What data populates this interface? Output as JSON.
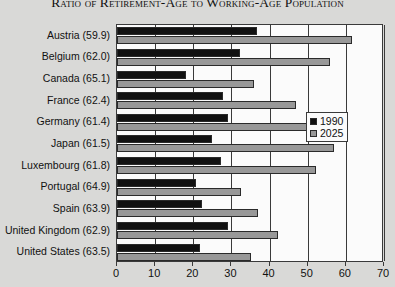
{
  "chart_data": {
    "type": "bar",
    "orientation": "horizontal",
    "title": "Ratio of Retirement-Age to Working-Age Population",
    "xlabel": "",
    "ylabel": "",
    "xlim": [
      0,
      70
    ],
    "xticks": [
      0,
      10,
      20,
      30,
      40,
      50,
      60,
      70
    ],
    "xticklabels": [
      "0",
      "10",
      "20",
      "30",
      "40",
      "50",
      "60",
      "70"
    ],
    "grid": true,
    "grid_axis": "x",
    "legend_position": "center right",
    "categories": [
      "Austria (59.9)",
      "Belgium (62.0)",
      "Canada (65.1)",
      "France (62.4)",
      "Germany (61.4)",
      "Japan (61.5)",
      "Luxembourg (61.8)",
      "Portugal (64.9)",
      "Spain (63.9)",
      "United Kingdom (62.9)",
      "United States (63.5)"
    ],
    "series": [
      {
        "name": "1990",
        "color": "#111111",
        "values": [
          36.8,
          32.2,
          18.2,
          27.8,
          29.2,
          25.0,
          27.2,
          20.8,
          22.4,
          29.2,
          21.8
        ]
      },
      {
        "name": "2025",
        "color": "#989898",
        "values": [
          61.5,
          55.8,
          35.8,
          46.8,
          54.0,
          56.8,
          52.2,
          32.6,
          37.0,
          42.2,
          35.2
        ]
      }
    ]
  },
  "legend": {
    "entries": [
      {
        "label": "1990"
      },
      {
        "label": "2025"
      }
    ]
  }
}
